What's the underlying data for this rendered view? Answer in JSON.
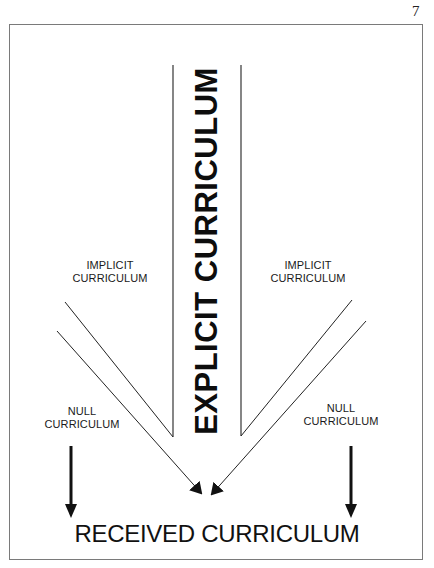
{
  "page": {
    "number": "7"
  },
  "diagram": {
    "explicit": {
      "label": "EXPLICIT CURRICULUM"
    },
    "implicit_left": {
      "line1": "IMPLICIT",
      "line2": "CURRICULUM"
    },
    "implicit_right": {
      "line1": "IMPLICIT",
      "line2": "CURRICULUM"
    },
    "null_left": {
      "line1": "NULL",
      "line2": "CURRICULUM"
    },
    "null_right": {
      "line1": "NULL",
      "line2": "CURRICULUM"
    },
    "received": {
      "label": "RECEIVED CURRICULUM"
    },
    "colors": {
      "ink": "#111111",
      "frame": "#7a7a7a",
      "background": "#ffffff"
    }
  }
}
